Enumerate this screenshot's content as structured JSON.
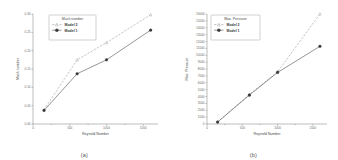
{
  "figure": {
    "panels": [
      {
        "caption": "(a)",
        "legend_title": "Mach number"
      },
      {
        "caption": "(b)",
        "legend_title": "Max. Pressure"
      }
    ]
  },
  "chart_data": [
    {
      "type": "line",
      "title": "",
      "panel_caption": "(a)",
      "xlabel": "Reynold Number",
      "ylabel": "Mach number",
      "legend_title": "Mach number",
      "legend_position": "top-left-inset",
      "grid": false,
      "xlim": [
        0,
        1700
      ],
      "ylim": [
        0.0,
        0.3
      ],
      "xticks": [
        0,
        500,
        1000,
        1500
      ],
      "xtick_labels": [
        "0",
        "500",
        "1000",
        "1500"
      ],
      "xminor_ticks": [
        250,
        750,
        1250
      ],
      "yticks": [
        0.0,
        0.05,
        0.1,
        0.15,
        0.2,
        0.25,
        0.3
      ],
      "ytick_labels": [
        "0.00",
        "0.05",
        "0.10",
        "0.15",
        "0.20",
        "0.25",
        "0.30"
      ],
      "series": [
        {
          "name": "Model 2",
          "style": "dashed",
          "marker": "open-triangle",
          "x": [
            150,
            600,
            1000,
            1600
          ],
          "y": [
            0.039,
            0.175,
            0.222,
            0.298
          ]
        },
        {
          "name": "Model 1",
          "style": "solid",
          "marker": "filled-circle",
          "x": [
            150,
            600,
            1000,
            1600
          ],
          "y": [
            0.037,
            0.137,
            0.175,
            0.256
          ]
        }
      ]
    },
    {
      "type": "line",
      "title": "",
      "panel_caption": "(b)",
      "xlabel": "Reynold Number",
      "ylabel": "Max. Pressure",
      "legend_title": "Max. Pressure",
      "legend_position": "top-left-inset",
      "grid": false,
      "xlim": [
        0,
        1700
      ],
      "ylim": [
        0,
        16000
      ],
      "xticks": [
        0,
        500,
        1000,
        1500
      ],
      "xtick_labels": [
        "0",
        "500",
        "1000",
        "1500"
      ],
      "xminor_ticks": [
        250,
        750,
        1250
      ],
      "yticks": [
        0,
        1000,
        2000,
        3000,
        4000,
        5000,
        6000,
        7000,
        8000,
        9000,
        10000,
        11000,
        12000,
        13000,
        14000,
        15000,
        16000
      ],
      "ytick_labels": [
        "0",
        "1000",
        "2000",
        "3000",
        "4000",
        "5000",
        "6000",
        "7000",
        "8000",
        "9000",
        "10000",
        "11000",
        "12000",
        "13000",
        "14000",
        "15000",
        "16000"
      ],
      "series": [
        {
          "name": "Model 2",
          "style": "dashed",
          "marker": "open-triangle",
          "x": [
            150,
            600,
            1000,
            1600
          ],
          "y": [
            300,
            4300,
            7600,
            16000
          ]
        },
        {
          "name": "Model 1",
          "style": "solid",
          "marker": "filled-circle",
          "x": [
            150,
            600,
            1000,
            1600
          ],
          "y": [
            280,
            4200,
            7500,
            11300
          ]
        }
      ]
    }
  ]
}
